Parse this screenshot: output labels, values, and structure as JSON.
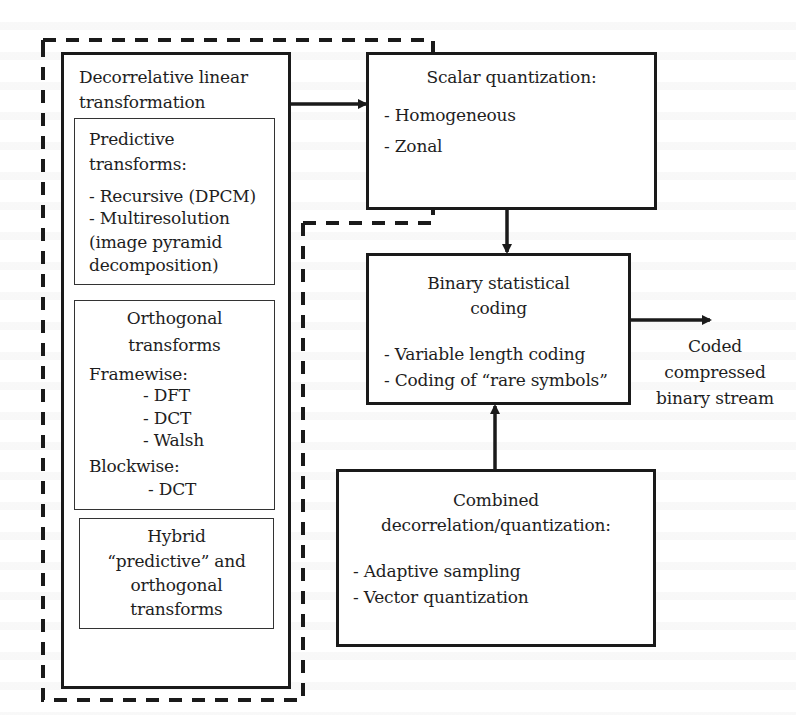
{
  "diagram": {
    "type": "block-diagram",
    "left_group": {
      "outline": "dashed",
      "title_lines": [
        "Decorrelative linear",
        "transformation"
      ],
      "predictive": {
        "title_lines": [
          "Predictive",
          "transforms:"
        ],
        "items": [
          "- Recursive (DPCM)",
          "- Multiresolution",
          "(image pyramid",
          "decomposition)"
        ]
      },
      "orthogonal": {
        "title_lines": [
          "Orthogonal",
          "transforms"
        ],
        "framewise_label": "Framewise:",
        "framewise_items": [
          "- DFT",
          "- DCT",
          "- Walsh"
        ],
        "blockwise_label": "Blockwise:",
        "blockwise_items": [
          "- DCT"
        ]
      },
      "hybrid": {
        "title_lines": [
          "Hybrid",
          "“predictive” and",
          "orthogonal",
          "transforms"
        ]
      }
    },
    "scalar_quantization": {
      "title": "Scalar quantization:",
      "items": [
        "- Homogeneous",
        "- Zonal"
      ]
    },
    "binary_coding": {
      "title_lines": [
        "Binary statistical",
        "coding"
      ],
      "items": [
        "- Variable length coding",
        "- Coding of “rare symbols”"
      ]
    },
    "combined": {
      "title_lines": [
        "Combined",
        "decorrelation/quantization:"
      ],
      "items": [
        "- Adaptive sampling",
        "- Vector quantization"
      ]
    },
    "output": {
      "lines": [
        "Coded",
        "compressed",
        "binary stream"
      ]
    },
    "edges": [
      {
        "from": "Decorrelative linear transformation",
        "to": "Scalar quantization"
      },
      {
        "from": "Scalar quantization",
        "to": "Binary statistical coding"
      },
      {
        "from": "Combined decorrelation/quantization",
        "to": "Binary statistical coding"
      },
      {
        "from": "Binary statistical coding",
        "to": "Coded compressed binary stream"
      }
    ],
    "colors": {
      "line": "#1a1a1a",
      "text": "#1e1e1e",
      "background": "#ffffff"
    }
  }
}
